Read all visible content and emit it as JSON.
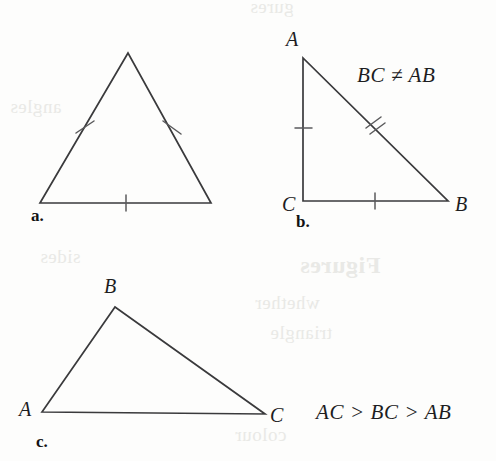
{
  "page": {
    "background_color": "#fdfdfc",
    "ink_color": "#3a3a3c",
    "label_color": "#1d1d1f"
  },
  "figure": {
    "parts": [
      {
        "key": "a",
        "part_label": "a.",
        "triangle_type": "equilateral",
        "vertex_labels": [],
        "relation_text": "",
        "tick_counts": {
          "left": 1,
          "right": 1,
          "base": 1
        }
      },
      {
        "key": "b",
        "part_label": "b.",
        "triangle_type": "right-isosceles-marked",
        "vertex_labels": [
          {
            "name": "A",
            "text": "A"
          },
          {
            "name": "C",
            "text": "C"
          },
          {
            "name": "B",
            "text": "B"
          }
        ],
        "relation_text": "BC ≠ AB",
        "tick_counts": {
          "leg_ac": 1,
          "hypotenuse_ab": 2,
          "base_cb": 1
        }
      },
      {
        "key": "c",
        "part_label": "c.",
        "triangle_type": "scalene",
        "vertex_labels": [
          {
            "name": "A",
            "text": "A"
          },
          {
            "name": "B",
            "text": "B"
          },
          {
            "name": "C",
            "text": "C"
          }
        ],
        "relation_text": "AC > BC > AB",
        "tick_counts": {}
      }
    ]
  },
  "ghost_text": {
    "lines": [
      "gures",
      "Figures",
      "whether",
      "triangle",
      "angles",
      "colour",
      "sides"
    ]
  }
}
